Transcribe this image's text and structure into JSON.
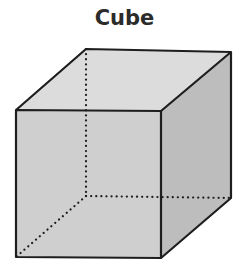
{
  "title": "Cube",
  "colors": {
    "edge": "#1e1e1e",
    "top_face": "#dcdcdc",
    "front_face": "#cfcfcf",
    "right_face": "#bdbdbd"
  },
  "shape": {
    "type": "cube",
    "visible_edges": "solid",
    "hidden_edges": "dotted"
  }
}
